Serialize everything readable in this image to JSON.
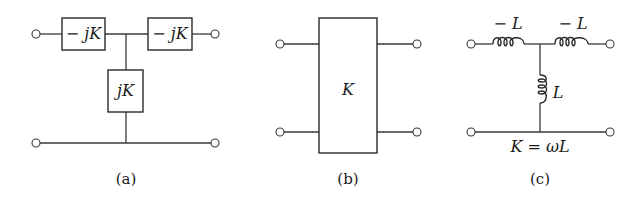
{
  "figure": {
    "panels": [
      {
        "id": "a",
        "caption": "(a)",
        "series_left_label": "− jK",
        "series_right_label": "− jK",
        "shunt_label": "jK"
      },
      {
        "id": "b",
        "caption": "(b)",
        "box_label": "K"
      },
      {
        "id": "c",
        "caption": "(c)",
        "series_left_label": "− L",
        "series_right_label": "− L",
        "shunt_label": "L",
        "relation": "K = ωL"
      }
    ],
    "colors": {
      "line": "#3a3a3a",
      "background": "#ffffff"
    }
  }
}
